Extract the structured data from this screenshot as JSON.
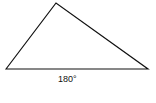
{
  "diagram": {
    "shape": "triangle",
    "vertices": [
      [
        6,
        69
      ],
      [
        56,
        3
      ],
      [
        148,
        69
      ]
    ],
    "stroke_color": "#111111",
    "base_label": "180°"
  }
}
